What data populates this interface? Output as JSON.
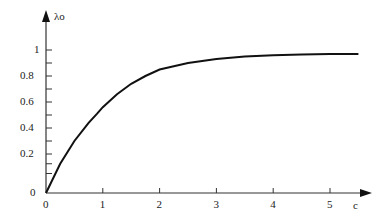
{
  "chart_data": {
    "type": "line",
    "title": "",
    "xlabel": "c",
    "ylabel": "λo",
    "x_ticks": [
      "0",
      "1",
      "2",
      "3",
      "4",
      "5"
    ],
    "y_ticks": [
      "0",
      "0.2",
      "0.4",
      "0.6",
      "0.8",
      "1"
    ],
    "xlim": [
      0,
      5.6
    ],
    "ylim": [
      0,
      1.1
    ],
    "grid": false,
    "series": [
      {
        "name": "λo(c)",
        "x": [
          0,
          0.25,
          0.5,
          0.75,
          0.9,
          1.0,
          1.25,
          1.5,
          1.75,
          2.0,
          2.5,
          3.0,
          3.5,
          4.0,
          4.5,
          5.0,
          5.5
        ],
        "values": [
          0,
          0.15,
          0.3,
          0.44,
          0.51,
          0.56,
          0.66,
          0.74,
          0.8,
          0.85,
          0.9,
          0.93,
          0.95,
          0.96,
          0.965,
          0.97,
          0.97
        ]
      }
    ]
  }
}
